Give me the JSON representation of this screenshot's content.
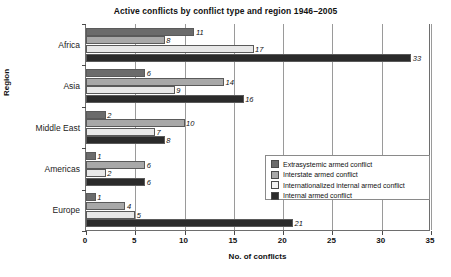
{
  "chart_data": {
    "type": "bar",
    "orientation": "horizontal",
    "title": "Active conflicts by conflict type and region 1946–2005",
    "xlabel": "No. of conflicts",
    "ylabel": "Region",
    "categories": [
      "Africa",
      "Asia",
      "Middle East",
      "Americas",
      "Europe"
    ],
    "series": [
      {
        "name": "Extrasystemic armed conflict",
        "color": "#6b6b6b",
        "values": [
          11,
          6,
          2,
          1,
          1
        ]
      },
      {
        "name": "Interstate armed conflict",
        "color": "#a8a8a8",
        "values": [
          8,
          14,
          10,
          6,
          4
        ]
      },
      {
        "name": "Internationalized internal armed conflict",
        "color": "#e8e8e8",
        "values": [
          17,
          9,
          7,
          2,
          5
        ]
      },
      {
        "name": "Internal armed conflict",
        "color": "#2b2b2b",
        "values": [
          33,
          16,
          8,
          6,
          21
        ]
      }
    ],
    "xlim": [
      0,
      35
    ],
    "xticks": [
      0,
      5,
      10,
      15,
      20,
      25,
      30,
      35
    ],
    "xtick_labels": [
      "0",
      "5",
      "10",
      "15",
      "20",
      "25",
      "30",
      "35"
    ],
    "grid": "vertical",
    "legend_position": "center-right-inside",
    "data_labels": true
  }
}
